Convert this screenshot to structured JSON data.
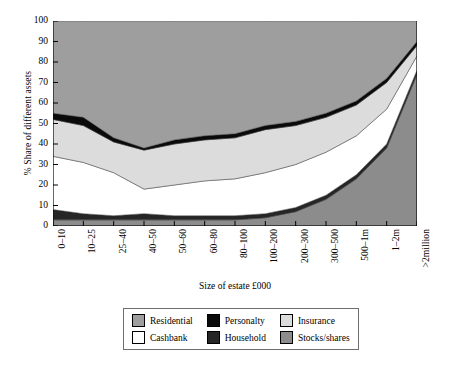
{
  "chart_data": {
    "type": "area",
    "title": "",
    "xlabel": "Size of estate £000",
    "ylabel": "% Share of different assets",
    "ylim": [
      0,
      100
    ],
    "yticks": [
      0,
      10,
      20,
      30,
      40,
      50,
      60,
      70,
      80,
      90,
      100
    ],
    "grid": false,
    "stacked": true,
    "legend_position": "bottom",
    "categories": [
      "0–10",
      "10–25",
      "25–40",
      "40–50",
      "50–60",
      "60–80",
      "80–100",
      "100–200",
      "200–300",
      "300–500",
      "500–1m",
      "1–2m",
      ">2million"
    ],
    "series": [
      {
        "name": "Stocks/shares",
        "color": "#8c8c8c",
        "values": [
          3,
          3,
          3,
          3,
          3,
          3,
          3,
          4,
          7,
          13,
          23,
          38,
          74
        ]
      },
      {
        "name": "Household",
        "color": "#262626",
        "values": [
          5,
          3,
          2,
          3,
          2,
          2,
          2,
          2,
          2,
          2,
          2,
          2,
          2
        ]
      },
      {
        "name": "Cashbank",
        "color": "#ffffff",
        "values": [
          26,
          25,
          21,
          12,
          15,
          17,
          18,
          20,
          21,
          21,
          19,
          17,
          7
        ]
      },
      {
        "name": "Insurance",
        "color": "#dcdcdc",
        "values": [
          18,
          18,
          15,
          19,
          20,
          20,
          20,
          21,
          19,
          17,
          15,
          13,
          5
        ]
      },
      {
        "name": "Personalty",
        "color": "#0a0a0a",
        "values": [
          3,
          4,
          2,
          1,
          2,
          2,
          2,
          2,
          2,
          2,
          2,
          2,
          2
        ]
      },
      {
        "name": "Residential",
        "color": "#9e9e9e",
        "values": [
          45,
          47,
          57,
          62,
          58,
          56,
          55,
          51,
          49,
          45,
          39,
          28,
          10
        ]
      }
    ],
    "cumulative_tops": {
      "stocks_shares": [
        3,
        3,
        3,
        3,
        3,
        3,
        3,
        4,
        7,
        13,
        23,
        38,
        74
      ],
      "household": [
        8,
        6,
        5,
        6,
        5,
        5,
        5,
        6,
        9,
        15,
        25,
        40,
        76
      ],
      "cashbank": [
        34,
        31,
        26,
        18,
        20,
        22,
        23,
        26,
        30,
        36,
        44,
        57,
        83
      ],
      "insurance": [
        52,
        49,
        41,
        37,
        40,
        42,
        43,
        47,
        49,
        53,
        59,
        70,
        88
      ],
      "personalty": [
        55,
        53,
        43,
        38,
        42,
        44,
        45,
        49,
        51,
        55,
        61,
        72,
        90
      ],
      "residential": [
        100,
        100,
        100,
        100,
        100,
        100,
        100,
        100,
        100,
        100,
        100,
        100,
        100
      ]
    }
  },
  "legend": {
    "items": [
      {
        "label": "Residential",
        "swatch": "#9e9e9e"
      },
      {
        "label": "Personalty",
        "swatch": "#0a0a0a"
      },
      {
        "label": "Insurance",
        "swatch": "#dcdcdc"
      },
      {
        "label": "Cashbank",
        "swatch": "#ffffff"
      },
      {
        "label": "Household",
        "swatch": "#262626"
      },
      {
        "label": "Stocks/shares",
        "swatch": "#8c8c8c"
      }
    ]
  },
  "axes": {
    "y_title": "% Share of different assets",
    "x_title": "Size of estate £000",
    "y_tick_labels": [
      "0",
      "10",
      "20",
      "30",
      "40",
      "50",
      "60",
      "70",
      "80",
      "90",
      "100"
    ],
    "x_tick_labels": [
      "0–10",
      "10–25",
      "25–40",
      "40–50",
      "50–60",
      "60–80",
      "80–100",
      "100–200",
      "200–300",
      "300–500",
      "500–1m",
      "1–2m",
      ">2million"
    ]
  }
}
